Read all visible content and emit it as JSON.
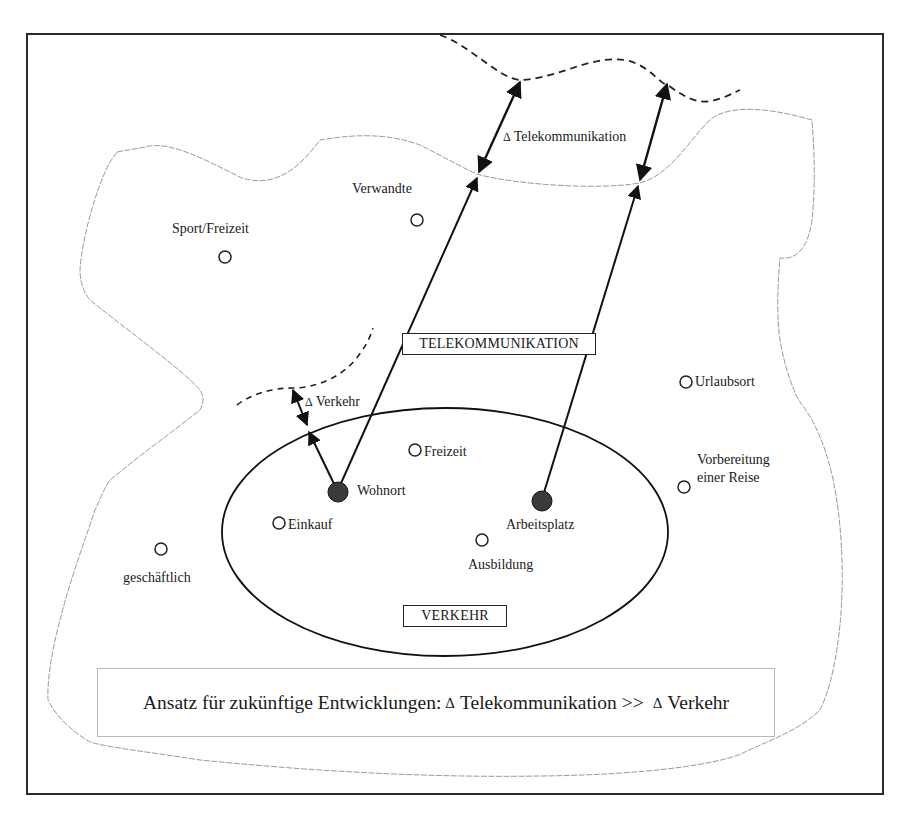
{
  "diagram": {
    "title_boxes": {
      "telekommunikation": "TELEKOMMUNIKATION",
      "verkehr": "VERKEHR"
    },
    "delta_labels": {
      "delta_symbol": "Δ",
      "telekommunikation": "Telekommunikation",
      "verkehr": "Verkehr"
    },
    "anchors": [
      {
        "id": "wohnort",
        "label": "Wohnort",
        "type": "filled-node"
      },
      {
        "id": "arbeitsplatz",
        "label": "Arbeitsplatz",
        "type": "filled-node"
      }
    ],
    "places": [
      {
        "id": "sport-freizeit",
        "label": "Sport/Freizeit",
        "zone": "outer"
      },
      {
        "id": "verwandte",
        "label": "Verwandte",
        "zone": "outer"
      },
      {
        "id": "urlaubsort",
        "label": "Urlaubsort",
        "zone": "outer"
      },
      {
        "id": "vorbereitung",
        "label_line1": "Vorbereitung",
        "label_line2": "einer Reise",
        "zone": "outer"
      },
      {
        "id": "geschaeftlich",
        "label": "geschäftlich",
        "zone": "outer"
      },
      {
        "id": "freizeit",
        "label": "Freizeit",
        "zone": "verkehr"
      },
      {
        "id": "einkauf",
        "label": "Einkauf",
        "zone": "verkehr"
      },
      {
        "id": "ausbildung",
        "label": "Ausbildung",
        "zone": "verkehr"
      }
    ],
    "summary": {
      "prefix": "Ansatz für zukünftige Entwicklungen:",
      "delta": "Δ",
      "left_term": "Telekommunikation >>",
      "right_term": "Verkehr"
    },
    "colors": {
      "frame": "#2a2a2a",
      "boundary": "#9a9a9a",
      "lines": "#111111",
      "node_fill": "#3a3a3a"
    }
  }
}
